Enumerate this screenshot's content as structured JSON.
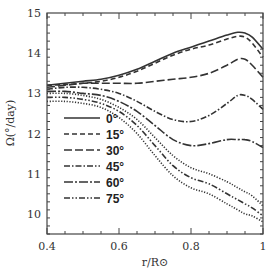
{
  "chart_data": {
    "type": "line",
    "title": "",
    "xlabel": "r/R⊙",
    "ylabel": "Ω(°/day)",
    "xlim": [
      0.4,
      1.0
    ],
    "ylim": [
      9.5,
      15
    ],
    "xticks": [
      0.4,
      0.6,
      0.8,
      1.0
    ],
    "xtick_labels": [
      "0.4",
      "0.6",
      "0.8",
      "1"
    ],
    "yticks": [
      10,
      11,
      12,
      13,
      14,
      15
    ],
    "ytick_labels": [
      "10",
      "11",
      "12",
      "13",
      "14",
      "15"
    ],
    "legend_position": "lower-left",
    "grid": false,
    "x": [
      0.4,
      0.45,
      0.5,
      0.55,
      0.6,
      0.65,
      0.7,
      0.75,
      0.8,
      0.85,
      0.9,
      0.93,
      0.95,
      0.97,
      1.0
    ],
    "series": [
      {
        "name": "0°",
        "style": "solid",
        "values": [
          13.2,
          13.25,
          13.3,
          13.35,
          13.45,
          13.6,
          13.8,
          14.0,
          14.15,
          14.3,
          14.45,
          14.52,
          14.5,
          14.4,
          14.1
        ]
      },
      {
        "name": "15°",
        "style": "dashed",
        "values": [
          13.2,
          13.22,
          13.25,
          13.3,
          13.4,
          13.55,
          13.75,
          13.95,
          14.1,
          14.2,
          14.35,
          14.42,
          14.4,
          14.25,
          13.9
        ]
      },
      {
        "name": "30°",
        "style": "longdash",
        "values": [
          13.15,
          13.2,
          13.25,
          13.25,
          13.25,
          13.25,
          13.3,
          13.35,
          13.4,
          13.5,
          13.7,
          13.85,
          13.85,
          13.7,
          13.4
        ]
      },
      {
        "name": "45°",
        "style": "dashdot",
        "values": [
          13.1,
          13.15,
          13.15,
          13.1,
          13.0,
          12.8,
          12.55,
          12.35,
          12.3,
          12.45,
          12.75,
          12.95,
          12.95,
          12.85,
          12.6
        ]
      },
      {
        "name": "60°",
        "style": "longdashdot",
        "values": [
          13.05,
          13.05,
          13.0,
          12.95,
          12.8,
          12.55,
          12.2,
          11.85,
          11.7,
          11.75,
          11.85,
          11.85,
          11.85,
          11.8,
          11.65
        ]
      },
      {
        "name": "75°",
        "style": "dashdotdot",
        "values": [
          12.9,
          12.9,
          12.85,
          12.75,
          12.55,
          12.2,
          11.7,
          11.2,
          10.9,
          10.75,
          10.5,
          10.35,
          10.25,
          10.15,
          9.95
        ]
      }
    ],
    "extra_band_lines": [
      {
        "name": "75° upper band",
        "style": "dotted",
        "values": [
          13.0,
          13.0,
          12.95,
          12.85,
          12.65,
          12.35,
          11.9,
          11.45,
          11.15,
          11.0,
          10.8,
          10.65,
          10.55,
          10.45,
          10.2
        ]
      },
      {
        "name": "75° lower band",
        "style": "dotted",
        "values": [
          12.8,
          12.8,
          12.75,
          12.65,
          12.4,
          12.0,
          11.45,
          10.95,
          10.65,
          10.5,
          10.25,
          10.1,
          10.0,
          9.95,
          9.8
        ]
      }
    ]
  }
}
